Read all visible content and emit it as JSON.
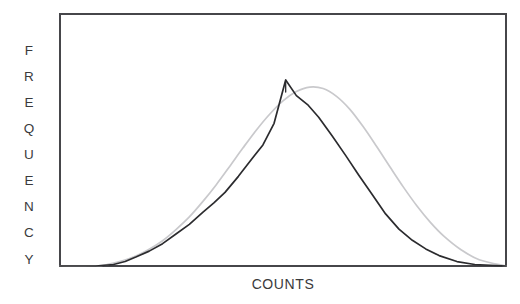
{
  "figure": {
    "background_color": "#ffffff",
    "frame": {
      "x0": 60,
      "y0": 14,
      "x1": 506,
      "y1": 266,
      "stroke_color": "#46464a",
      "stroke_width": 1.6
    },
    "ylabel_letters": [
      "F",
      "R",
      "E",
      "Q",
      "U",
      "E",
      "N",
      "C",
      "Y"
    ]
  },
  "chart_data": {
    "type": "line",
    "title": "",
    "subtitle": "",
    "xlabel": "COUNTS",
    "ylabel": "FREQUENCY",
    "grid": false,
    "legend": "none",
    "xlim": [
      0,
      100
    ],
    "ylim": [
      0,
      100
    ],
    "xticks": [],
    "yticks": [],
    "xticklabels": [],
    "yticklabels": [],
    "annotations": [
      {
        "name": "peak-tick",
        "text": "",
        "x": 50.6,
        "y": 100,
        "description": "short vertical tick mark drawn at the apex of the measured distribution"
      }
    ],
    "series": [
      {
        "name": "measured-distribution",
        "style": "solid",
        "color": "#2b2b2e",
        "width": 1.7,
        "comment": "dark piecewise-linear polyline - observed counts histogram envelope",
        "x": [
          0.0,
          8.0,
          12.0,
          14.6,
          17.0,
          20.0,
          23.0,
          26.0,
          29.0,
          32.0,
          34.5,
          37.0,
          40.0,
          43.0,
          45.5,
          48.0,
          50.6,
          53.0,
          55.5,
          58.0,
          61.0,
          64.0,
          67.0,
          70.0,
          73.0,
          76.0,
          79.0,
          82.0,
          85.0,
          89.0,
          93.0,
          100.0
        ],
        "y": [
          0.0,
          0.0,
          0.8,
          2.4,
          4.8,
          8.0,
          12.0,
          17.2,
          22.4,
          28.8,
          33.9,
          39.6,
          48.2,
          57.5,
          65.1,
          76.7,
          100.0,
          91.6,
          86.8,
          80.0,
          70.0,
          59.6,
          48.8,
          38.4,
          28.0,
          19.8,
          13.8,
          9.2,
          5.6,
          2.4,
          0.8,
          0.0
        ]
      },
      {
        "name": "fitted-gaussian",
        "style": "solid",
        "color": "#c9c9cc",
        "width": 1.7,
        "comment": "light grey smooth gaussian reference curve fitted to the distribution",
        "x": [
          0.0,
          8.0,
          11.0,
          14.0,
          17.0,
          20.0,
          23.0,
          26.0,
          29.0,
          32.0,
          35.0,
          38.0,
          41.0,
          44.0,
          47.0,
          50.0,
          53.0,
          56.0,
          59.0,
          62.0,
          65.0,
          68.0,
          71.0,
          74.0,
          77.0,
          80.0,
          83.0,
          86.0,
          90.0,
          94.0,
          100.0
        ],
        "y": [
          0.0,
          0.0,
          1.0,
          2.8,
          5.4,
          9.0,
          13.6,
          19.6,
          26.4,
          34.6,
          43.6,
          53.4,
          63.4,
          73.0,
          81.6,
          88.8,
          93.8,
          96.2,
          95.4,
          91.2,
          84.2,
          74.8,
          64.2,
          53.2,
          42.4,
          32.4,
          23.6,
          16.2,
          8.6,
          3.4,
          0.0
        ]
      }
    ]
  }
}
